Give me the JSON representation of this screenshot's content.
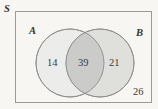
{
  "figure": {
    "type": "venn-diagram",
    "universal_set_label": "S",
    "set_a_label": "A",
    "set_b_label": "B",
    "region_a_only": "14",
    "region_intersection": "39",
    "region_b_only": "21",
    "region_outside": "26"
  },
  "colors": {
    "background": "#f7f6f3",
    "rect_border": "#9a9a96",
    "circle_a_fill": "#ececeb",
    "circle_b_fill": "#dcdcda",
    "intersection_fill": "#cbcbc9",
    "circle_stroke": "#8e8e8c",
    "text": "#3a3a3a"
  },
  "geometry": {
    "rect": {
      "x": 15,
      "y": 11,
      "width": 137,
      "height": 92
    },
    "circle_a": {
      "cx": 70,
      "cy": 63,
      "r": 34
    },
    "circle_b": {
      "cx": 100,
      "cy": 63,
      "r": 34
    }
  }
}
